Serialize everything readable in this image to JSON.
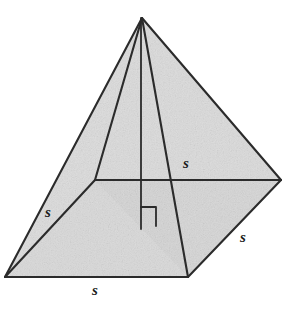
{
  "figure": {
    "name": "square-pyramid-diagram",
    "canvas": {
      "width": 301,
      "height": 314
    },
    "colors": {
      "background": "#ffffff",
      "face_fill": "#d7d7d7",
      "face_fill_light": "#dedede",
      "edge_stroke": "#2b2b2b",
      "label_color": "#1b1b1b"
    },
    "stroke_width": 2.1,
    "vertices": {
      "apex": {
        "label": "apex",
        "x": 142,
        "y": 18
      },
      "base_left": {
        "label": "base-left",
        "x": 5,
        "y": 277
      },
      "base_front": {
        "label": "base-front",
        "x": 188,
        "y": 277
      },
      "base_right": {
        "label": "base-right",
        "x": 281,
        "y": 180
      },
      "base_back": {
        "label": "base-back",
        "x": 95,
        "y": 180
      },
      "base_center": {
        "label": "base-center",
        "x": 141,
        "y": 229
      }
    },
    "altitude": {
      "name": "altitude-segment",
      "from_x": 141,
      "from_y": 18,
      "to_x": 141,
      "to_y": 229
    },
    "right_angle_mark": {
      "name": "right-angle-mark",
      "x": 141,
      "y": 207,
      "size": 15
    }
  },
  "labels": [
    {
      "id": "s-top",
      "text": "s",
      "x": 186,
      "y": 163
    },
    {
      "id": "s-left",
      "text": "s",
      "x": 48,
      "y": 212
    },
    {
      "id": "s-right",
      "text": "s",
      "x": 243,
      "y": 237
    },
    {
      "id": "s-bottom",
      "text": "s",
      "x": 95,
      "y": 290
    }
  ]
}
